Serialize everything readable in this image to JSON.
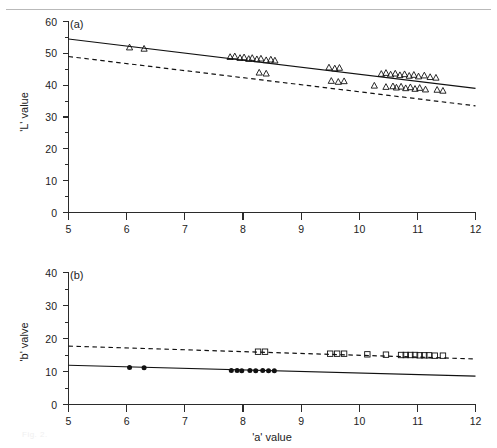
{
  "figure": {
    "ghost_caption": "Fig. 2.",
    "x_axis_title": "'a' value",
    "panels": [
      {
        "tag": "(a)",
        "y_axis_title": "'L' value"
      },
      {
        "tag": "(b)",
        "y_axis_title": "'b' valve"
      }
    ]
  },
  "chart_data": [
    {
      "type": "scatter",
      "title": "(a)",
      "xlabel": "'a' value",
      "ylabel": "'L' value",
      "xlim": [
        5,
        12
      ],
      "ylim": [
        0,
        60
      ],
      "xticks": [
        5,
        6,
        7,
        8,
        9,
        10,
        11,
        12
      ],
      "xtick_labels": [
        "5",
        "6",
        "7",
        "8",
        "9",
        "10",
        "11",
        "12"
      ],
      "yticks": [
        0,
        10,
        20,
        30,
        40,
        50,
        60
      ],
      "ytick_labels": [
        "0",
        "10",
        "20",
        "30",
        "40",
        "50",
        "60"
      ],
      "y_minor_ticks": [
        5,
        15,
        25,
        35,
        45,
        55
      ],
      "grid": false,
      "legend": "none",
      "series": [
        {
          "name": "upper group",
          "marker": "open-triangle",
          "line": "solid",
          "fit_line": {
            "x": [
              5,
              12
            ],
            "y": [
              54.5,
              39.0
            ]
          },
          "points": [
            {
              "x": 6.05,
              "y": 51.9
            },
            {
              "x": 6.3,
              "y": 51.5
            },
            {
              "x": 7.78,
              "y": 48.9
            },
            {
              "x": 7.86,
              "y": 49.1
            },
            {
              "x": 7.95,
              "y": 48.6
            },
            {
              "x": 8.02,
              "y": 48.8
            },
            {
              "x": 8.1,
              "y": 48.3
            },
            {
              "x": 8.16,
              "y": 48.6
            },
            {
              "x": 8.24,
              "y": 48.2
            },
            {
              "x": 8.31,
              "y": 48.4
            },
            {
              "x": 8.4,
              "y": 47.9
            },
            {
              "x": 8.48,
              "y": 48.1
            },
            {
              "x": 8.55,
              "y": 47.8
            },
            {
              "x": 9.48,
              "y": 45.6
            },
            {
              "x": 9.58,
              "y": 45.3
            },
            {
              "x": 9.66,
              "y": 45.5
            },
            {
              "x": 10.38,
              "y": 43.6
            },
            {
              "x": 10.46,
              "y": 43.9
            },
            {
              "x": 10.54,
              "y": 43.4
            },
            {
              "x": 10.62,
              "y": 43.7
            },
            {
              "x": 10.7,
              "y": 43.2
            },
            {
              "x": 10.78,
              "y": 43.5
            },
            {
              "x": 10.86,
              "y": 43.0
            },
            {
              "x": 10.94,
              "y": 43.3
            },
            {
              "x": 11.02,
              "y": 42.8
            },
            {
              "x": 11.12,
              "y": 43.1
            },
            {
              "x": 11.22,
              "y": 42.6
            },
            {
              "x": 11.32,
              "y": 42.4
            }
          ]
        },
        {
          "name": "lower group",
          "marker": "open-triangle",
          "line": "dashed",
          "fit_line": {
            "x": [
              5,
              12
            ],
            "y": [
              49.0,
              33.5
            ]
          },
          "points": [
            {
              "x": 8.28,
              "y": 44.0
            },
            {
              "x": 8.4,
              "y": 43.7
            },
            {
              "x": 9.52,
              "y": 41.4
            },
            {
              "x": 9.64,
              "y": 41.1
            },
            {
              "x": 9.74,
              "y": 41.3
            },
            {
              "x": 10.26,
              "y": 39.9
            },
            {
              "x": 10.46,
              "y": 39.5
            },
            {
              "x": 10.58,
              "y": 39.7
            },
            {
              "x": 10.64,
              "y": 39.3
            },
            {
              "x": 10.72,
              "y": 39.6
            },
            {
              "x": 10.8,
              "y": 39.1
            },
            {
              "x": 10.88,
              "y": 39.4
            },
            {
              "x": 10.96,
              "y": 38.9
            },
            {
              "x": 11.04,
              "y": 39.2
            },
            {
              "x": 11.14,
              "y": 38.7
            },
            {
              "x": 11.34,
              "y": 38.6
            },
            {
              "x": 11.44,
              "y": 38.3
            }
          ]
        }
      ]
    },
    {
      "type": "scatter",
      "title": "(b)",
      "xlabel": "'a' value",
      "ylabel": "'b' valve",
      "xlim": [
        5,
        12
      ],
      "ylim": [
        0,
        40
      ],
      "xticks": [
        5,
        6,
        7,
        8,
        9,
        10,
        11,
        12
      ],
      "xtick_labels": [
        "5",
        "6",
        "7",
        "8",
        "9",
        "10",
        "11",
        "12"
      ],
      "yticks": [
        0,
        10,
        20,
        30,
        40
      ],
      "ytick_labels": [
        "0",
        "10",
        "20",
        "30",
        "40"
      ],
      "y_minor_ticks": [
        5,
        15,
        25,
        35
      ],
      "grid": false,
      "legend": "none",
      "series": [
        {
          "name": "upper group",
          "marker": "open-square",
          "line": "dashed",
          "fit_line": {
            "x": [
              5,
              12
            ],
            "y": [
              17.7,
              13.8
            ]
          },
          "points": [
            {
              "x": 8.26,
              "y": 16.0
            },
            {
              "x": 8.38,
              "y": 16.0
            },
            {
              "x": 9.5,
              "y": 15.4
            },
            {
              "x": 9.62,
              "y": 15.4
            },
            {
              "x": 9.74,
              "y": 15.4
            },
            {
              "x": 10.14,
              "y": 15.2
            },
            {
              "x": 10.46,
              "y": 15.1
            },
            {
              "x": 10.72,
              "y": 15.0
            },
            {
              "x": 10.8,
              "y": 15.0
            },
            {
              "x": 10.88,
              "y": 15.0
            },
            {
              "x": 10.96,
              "y": 15.0
            },
            {
              "x": 11.04,
              "y": 14.9
            },
            {
              "x": 11.12,
              "y": 14.9
            },
            {
              "x": 11.2,
              "y": 14.9
            },
            {
              "x": 11.3,
              "y": 14.8
            },
            {
              "x": 11.44,
              "y": 14.8
            }
          ]
        },
        {
          "name": "lower group",
          "marker": "filled-circle",
          "line": "solid",
          "fit_line": {
            "x": [
              5,
              12
            ],
            "y": [
              11.9,
              8.6
            ]
          },
          "points": [
            {
              "x": 6.05,
              "y": 11.2
            },
            {
              "x": 6.3,
              "y": 11.1
            },
            {
              "x": 7.8,
              "y": 10.3
            },
            {
              "x": 7.9,
              "y": 10.3
            },
            {
              "x": 7.98,
              "y": 10.2
            },
            {
              "x": 8.12,
              "y": 10.3
            },
            {
              "x": 8.22,
              "y": 10.2
            },
            {
              "x": 8.34,
              "y": 10.3
            },
            {
              "x": 8.44,
              "y": 10.2
            },
            {
              "x": 8.54,
              "y": 10.2
            }
          ]
        }
      ]
    }
  ]
}
